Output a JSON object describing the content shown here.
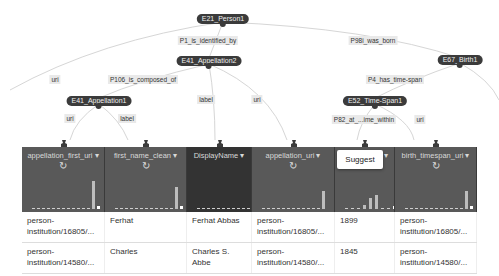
{
  "graph": {
    "nodes": [
      {
        "id": "n_person",
        "label": "E21_Person1",
        "x": 223,
        "y": 19
      },
      {
        "id": "n_app2",
        "label": "E41_Appellation2",
        "x": 209,
        "y": 61
      },
      {
        "id": "n_app1",
        "label": "E41_Appellation1",
        "x": 99,
        "y": 101
      },
      {
        "id": "n_birth",
        "label": "E67_Birth1",
        "x": 460,
        "y": 60
      },
      {
        "id": "n_time",
        "label": "E52_Time-Span1",
        "x": 375,
        "y": 101
      }
    ],
    "edge_labels": [
      {
        "label": "P1_is_identified_by",
        "x": 208,
        "y": 40
      },
      {
        "label": "P98i_was_born",
        "x": 373,
        "y": 40
      },
      {
        "label": "uri",
        "x": 55,
        "y": 79
      },
      {
        "label": "P106_is_composed_of",
        "x": 143,
        "y": 79
      },
      {
        "label": "label",
        "x": 206,
        "y": 99
      },
      {
        "label": "uri",
        "x": 257,
        "y": 99
      },
      {
        "label": "P4_has_time-span",
        "x": 395,
        "y": 79
      },
      {
        "label": "uri",
        "x": 70,
        "y": 118
      },
      {
        "label": "label",
        "x": 127,
        "y": 118
      },
      {
        "label": "P82_at_...ime_within",
        "x": 364,
        "y": 119
      },
      {
        "label": "uri",
        "x": 420,
        "y": 119
      }
    ]
  },
  "columns": [
    {
      "name": "appellation_first_uri",
      "dropdown": "▾",
      "refresh": true,
      "width": 83,
      "dark": false,
      "bars": [
        1,
        1,
        1,
        1,
        1,
        1,
        1,
        1,
        1,
        1,
        1,
        1,
        28
      ],
      "last_white": true
    },
    {
      "name": "first_name_clean",
      "dropdown": "▾",
      "refresh": true,
      "width": 82,
      "dark": false,
      "bars": [
        1,
        1,
        1,
        1,
        1,
        1,
        1,
        1,
        1,
        1,
        1,
        1,
        22
      ],
      "last_white": true
    },
    {
      "name": "DisplayName",
      "dropdown": "▾",
      "refresh": false,
      "width": 65,
      "dark": true,
      "bars": [
        1,
        1,
        1,
        1,
        1,
        1,
        1,
        1,
        1,
        1,
        1,
        1,
        18
      ],
      "last_white": false
    },
    {
      "name": "appellation_uri",
      "dropdown": "▾",
      "refresh": true,
      "width": 83,
      "dark": false,
      "bars": [
        1,
        1,
        1,
        1,
        1,
        1,
        1,
        1,
        1,
        1,
        1,
        1,
        18
      ],
      "last_white": false
    },
    {
      "name": "",
      "dropdown": "▾",
      "refresh": false,
      "width": 60,
      "dark": false,
      "bars": [
        1,
        1,
        1,
        4,
        11,
        14,
        1,
        1
      ],
      "last_white": true
    },
    {
      "name": "birth_timespan_uri",
      "dropdown": "▾",
      "refresh": true,
      "width": 82,
      "dark": false,
      "bars": [
        1,
        1,
        1,
        1,
        1,
        1,
        1,
        1,
        1,
        1,
        1,
        1,
        18
      ],
      "last_white": true
    }
  ],
  "suggest_label": "Suggest",
  "rows": [
    [
      "person-institution/16805/...",
      "Ferhat",
      "Ferhat Abbas",
      "person-institution/16805/...",
      "1899",
      "person-institution/16805/..."
    ],
    [
      "person-institution/14580/...",
      "Charles",
      "Charles S. Abbe",
      "person-institution/14580/...",
      "1845",
      "person-institution/14580/..."
    ]
  ],
  "colors": {
    "header": "#595959",
    "header_dark": "#333333",
    "node": "#3b3b3b",
    "edge_label_bg": "#e9e9e9",
    "link": "#d0d0d0"
  }
}
